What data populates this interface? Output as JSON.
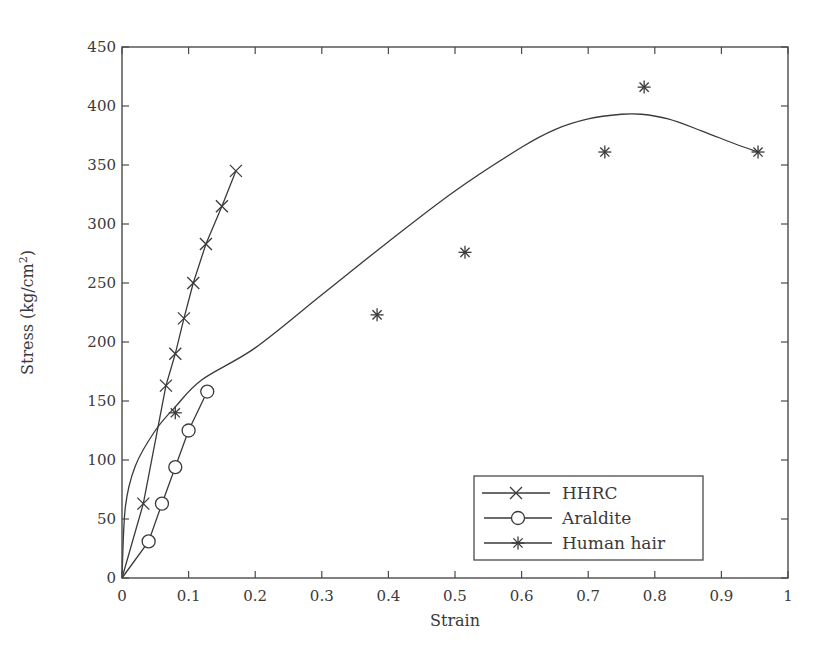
{
  "chart_data": {
    "type": "scatter",
    "title": "",
    "xlabel": "Strain",
    "ylabel": "Stress (kg/cm",
    "ylabel_superscript": "2",
    "ylabel_suffix": ")",
    "xlim": [
      0,
      1
    ],
    "ylim": [
      0,
      450
    ],
    "x_ticks": [
      "0",
      "0.1",
      "0.2",
      "0.3",
      "0.4",
      "0.5",
      "0.6",
      "0.7",
      "0.8",
      "0.9",
      "1"
    ],
    "y_ticks": [
      "0",
      "50",
      "100",
      "150",
      "200",
      "250",
      "300",
      "350",
      "400",
      "450"
    ],
    "grid": false,
    "legend_position": "lower right",
    "series": [
      {
        "name": "HHRC",
        "marker": "x",
        "line": "connected",
        "x": [
          0.0,
          0.032,
          0.066,
          0.08,
          0.093,
          0.107,
          0.126,
          0.15,
          0.171
        ],
        "y": [
          0,
          63,
          163,
          190,
          220,
          250,
          283,
          315,
          345
        ]
      },
      {
        "name": "Araldite",
        "marker": "o",
        "line": "connected",
        "x": [
          0.0,
          0.04,
          0.06,
          0.08,
          0.1,
          0.128
        ],
        "y": [
          0,
          31,
          63,
          94,
          125,
          158
        ]
      },
      {
        "name": "Human hair",
        "marker": "*",
        "line": "smooth fit curve",
        "x": [
          0.08,
          0.383,
          0.515,
          0.725,
          0.784,
          0.955
        ],
        "y": [
          140,
          223,
          276,
          361,
          416,
          361
        ],
        "fit_curve": {
          "x": [
            0.0,
            0.005,
            0.02,
            0.05,
            0.08,
            0.12,
            0.2,
            0.3,
            0.4,
            0.5,
            0.6,
            0.65,
            0.7,
            0.75,
            0.78,
            0.82,
            0.87,
            0.92,
            0.955
          ],
          "y": [
            0,
            60,
            95,
            125,
            145,
            168,
            195,
            240,
            285,
            328,
            365,
            380,
            389,
            393,
            393,
            389,
            379,
            368,
            361
          ]
        }
      }
    ]
  },
  "legend": {
    "items": [
      {
        "label": "HHRC",
        "marker": "x"
      },
      {
        "label": "Araldite",
        "marker": "o"
      },
      {
        "label": "Human hair",
        "marker": "*"
      }
    ]
  },
  "colors": {
    "line": "#3a3a3a",
    "axis": "#4a4a4a",
    "background": "#ffffff"
  }
}
